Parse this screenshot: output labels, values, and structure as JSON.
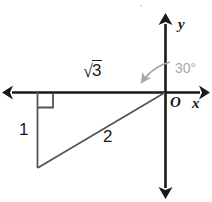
{
  "figure": {
    "kind": "coordinate-plane-right-triangle",
    "background_color": "#ffffff",
    "stroke_color": "#1a1a1a",
    "triangle_stroke_color": "#555555",
    "angle_color": "#a8a8a8",
    "axes": {
      "x_axis_label": "x",
      "y_axis_label": "y",
      "origin_label": "O",
      "x_axis_y": 92,
      "y_axis_x": 165,
      "x_left_end": 6,
      "x_right_end": 206,
      "y_top_end": 18,
      "y_bottom_end": 194,
      "arrowheads": [
        "left",
        "right",
        "up",
        "down"
      ]
    },
    "triangle": {
      "vertices": {
        "origin": [
          165,
          92
        ],
        "top_left": [
          37,
          92
        ],
        "bottom_left": [
          37,
          168
        ]
      },
      "right_angle_marker": {
        "at_vertex": "top_left",
        "size": 15
      },
      "labels": {
        "base": {
          "radical_sign": "√",
          "radicand": "3",
          "full_text": "√3"
        },
        "leg_vertical": "1",
        "hypotenuse": "2"
      }
    },
    "angle": {
      "value": "30°",
      "measured_from": "positive-y-axis",
      "measured_to": "hypotenuse",
      "arc_color": "#a8a8a8",
      "arrow_direction": "clockwise-to-counterclockwise-sweep-down-left"
    },
    "artifact": {
      "speck_color": "#d9d9d9"
    }
  }
}
